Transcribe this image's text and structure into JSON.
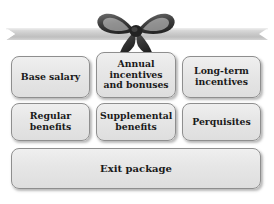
{
  "diagram": {
    "name": "executive-compensation-components",
    "background_color": "#ffffff",
    "decoration": {
      "ribbon_band": {
        "icon": "ribbon-banner",
        "color": "#c9c9c9",
        "color_light": "#e3e3e3",
        "color_dark": "#a8a8a8"
      },
      "bow": {
        "icon": "ribbon-bow",
        "color": "#4a4a4a",
        "color_dark": "#2b2b2b",
        "color_light": "#6e6e6e"
      }
    },
    "box_style": {
      "fill_top": "#efefef",
      "fill_bottom": "#dedede",
      "border_color": "#8e8e8e",
      "text_color": "#1a1a1a"
    },
    "rows": [
      {
        "name": "row-1",
        "boxes": [
          {
            "id": "base-salary",
            "label": "Base salary"
          },
          {
            "id": "annual-incentives",
            "label": "Annual incentives and bonuses"
          },
          {
            "id": "long-term-incentives",
            "label": "Long-term incentives"
          }
        ]
      },
      {
        "name": "row-2",
        "boxes": [
          {
            "id": "regular-benefits",
            "label": "Regular benefits"
          },
          {
            "id": "supplemental-benefits",
            "label": "Supplemental benefits"
          },
          {
            "id": "perquisites",
            "label": "Perquisites"
          }
        ]
      },
      {
        "name": "row-3",
        "boxes": [
          {
            "id": "exit-package",
            "label": "Exit package"
          }
        ]
      }
    ]
  }
}
